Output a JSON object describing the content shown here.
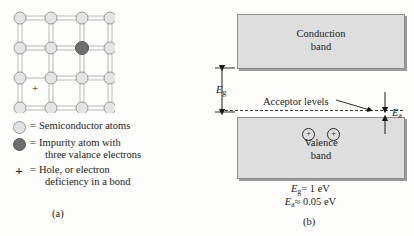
{
  "figure": {
    "panel_a": {
      "caption": "(a)",
      "lattice": {
        "rows": 4,
        "cols": 4,
        "impurity_position": {
          "row": 1,
          "col": 2
        },
        "hole_symbol": "+",
        "hole_position": {
          "row": 2,
          "col": 0
        },
        "atom_color": "#e2e2e2",
        "impurity_color": "#6e6e6e",
        "bond_color": "#b4b4b4"
      },
      "legend": [
        {
          "marker": "light-circle-icon",
          "equals": "=",
          "line1": "Semiconductor atoms",
          "line2": ""
        },
        {
          "marker": "dark-circle-icon",
          "equals": "=",
          "line1": "Impurity atom with",
          "line2": "three valance electrons"
        },
        {
          "marker": "plus-icon",
          "equals": "=",
          "line1": "Hole, or electron",
          "line2": "deficiency in a bond"
        }
      ]
    },
    "panel_b": {
      "caption": "(b)",
      "conduction_band": {
        "line1": "Conduction",
        "line2": "band"
      },
      "valence_band": {
        "line1": "Valence",
        "line2": "band"
      },
      "acceptor_label": "Acceptor levels",
      "holes": [
        "+",
        "+"
      ],
      "energy_gap_label": "E",
      "energy_gap_sub": "g",
      "acceptor_energy_label": "E",
      "acceptor_energy_sub": "a",
      "equation_1": {
        "symbol": "E",
        "sub": "g",
        "rel": "= 1 eV"
      },
      "equation_2": {
        "symbol": "E",
        "sub": "a",
        "rel": "≈ 0.05 eV"
      },
      "band_fill": "#dedede",
      "band_border": "#8d8d8d"
    }
  }
}
